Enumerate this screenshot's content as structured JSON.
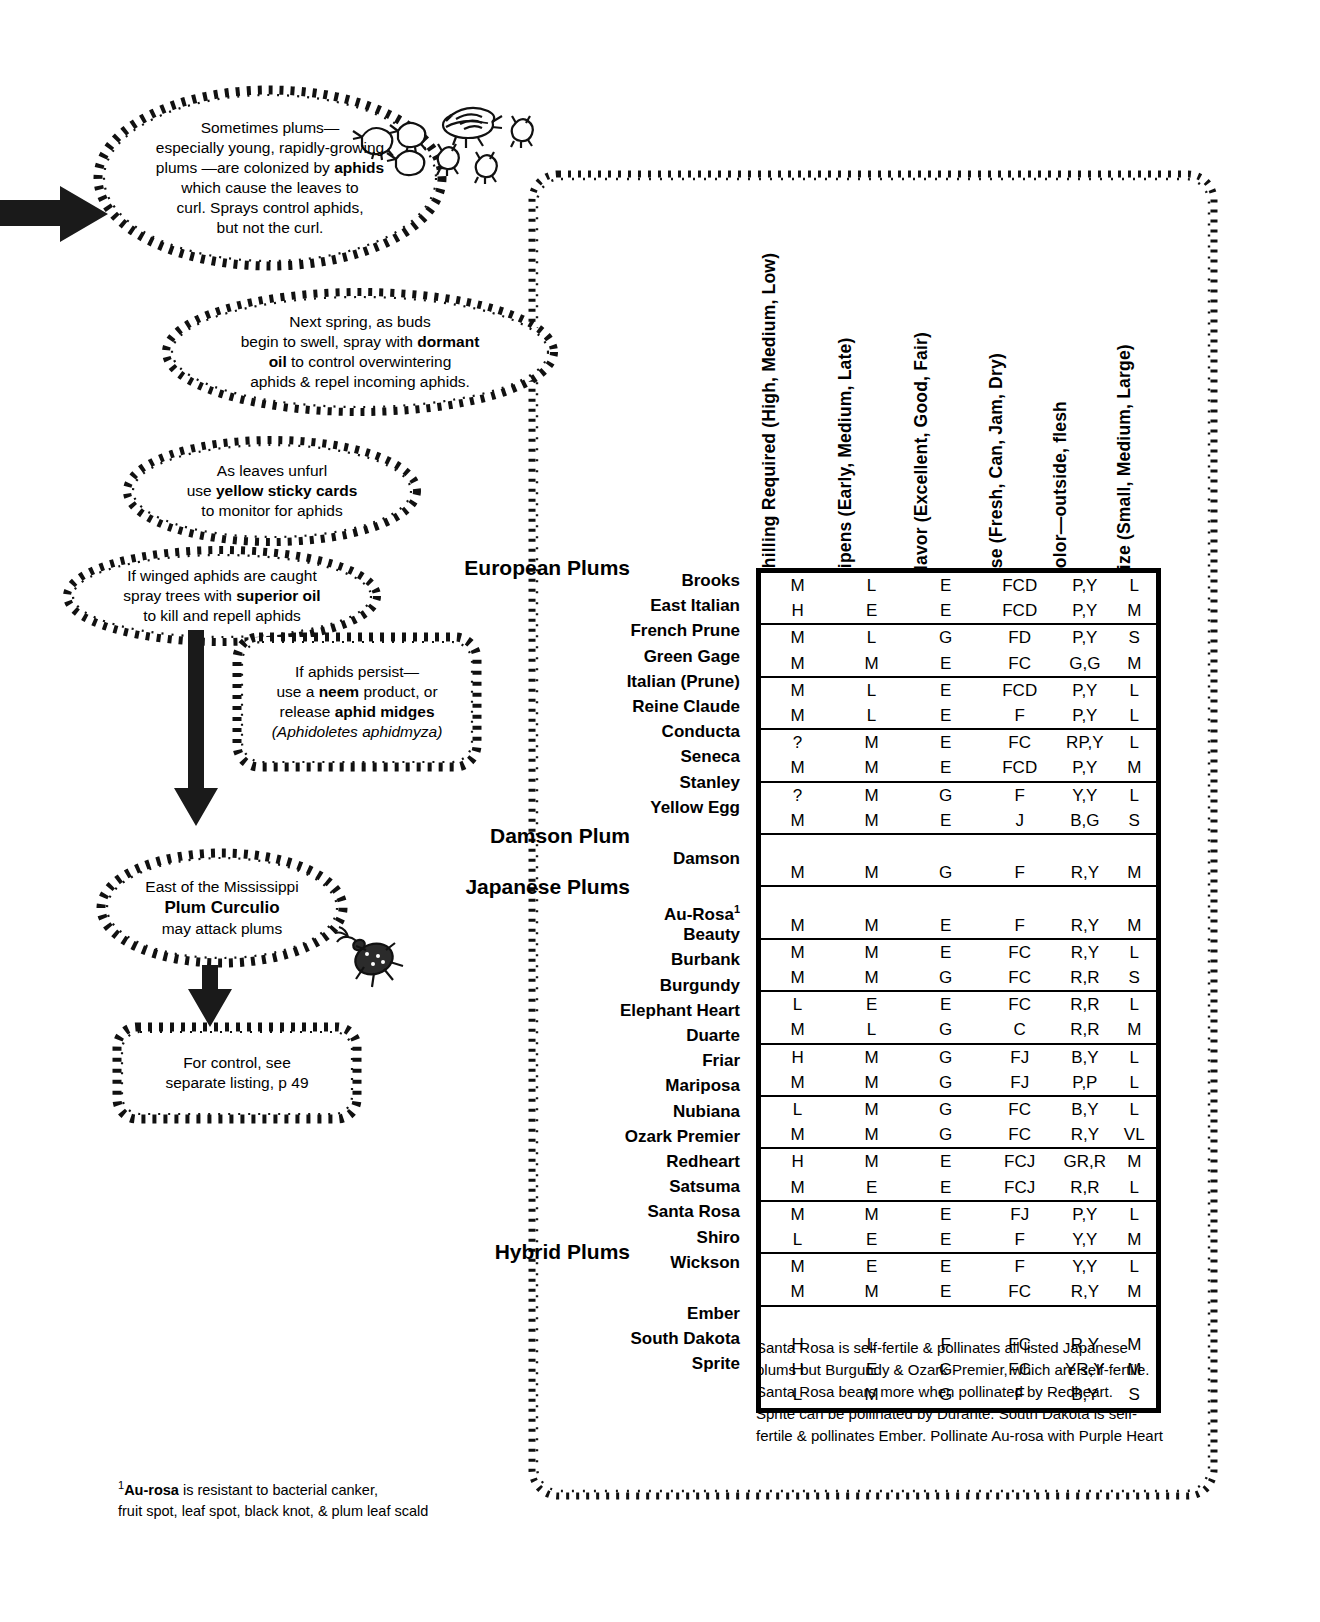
{
  "callouts": [
    {
      "id": "aphid-colonization",
      "lines": [
        {
          "runs": [
            {
              "t": "Sometimes plums—",
              "b": false
            }
          ]
        },
        {
          "runs": [
            {
              "t": "especially young, rapidly-growing",
              "b": false
            }
          ]
        },
        {
          "runs": [
            {
              "t": "plums —are colonized by ",
              "b": false
            },
            {
              "t": "aphids",
              "b": true
            }
          ]
        },
        {
          "runs": [
            {
              "t": "which cause the leaves to",
              "b": false
            }
          ]
        },
        {
          "runs": [
            {
              "t": "curl.  Sprays control aphids,",
              "b": false
            }
          ]
        },
        {
          "runs": [
            {
              "t": "but not the curl.",
              "b": false
            }
          ]
        }
      ]
    },
    {
      "id": "dormant-oil",
      "lines": [
        {
          "runs": [
            {
              "t": "Next spring, as buds",
              "b": false
            }
          ]
        },
        {
          "runs": [
            {
              "t": "begin to swell, spray with ",
              "b": false
            },
            {
              "t": "dormant",
              "b": true
            }
          ]
        },
        {
          "runs": [
            {
              "t": "oil",
              "b": true
            },
            {
              "t": "  to control overwintering",
              "b": false
            }
          ]
        },
        {
          "runs": [
            {
              "t": "aphids & repel incoming aphids.",
              "b": false
            }
          ]
        }
      ]
    },
    {
      "id": "yellow-sticky-cards",
      "lines": [
        {
          "runs": [
            {
              "t": "As leaves unfurl",
              "b": false
            }
          ]
        },
        {
          "runs": [
            {
              "t": "use ",
              "b": false
            },
            {
              "t": "yellow sticky cards",
              "b": true
            }
          ]
        },
        {
          "runs": [
            {
              "t": "to monitor for aphids",
              "b": false
            }
          ]
        }
      ]
    },
    {
      "id": "superior-oil",
      "lines": [
        {
          "runs": [
            {
              "t": "If winged aphids are caught",
              "b": false
            }
          ]
        },
        {
          "runs": [
            {
              "t": "spray trees with ",
              "b": false
            },
            {
              "t": "superior oil",
              "b": true
            }
          ]
        },
        {
          "runs": [
            {
              "t": "to kill and repell aphids",
              "b": false
            }
          ]
        }
      ]
    },
    {
      "id": "neem-aphid-midges",
      "lines": [
        {
          "runs": [
            {
              "t": "If aphids persist—",
              "b": false
            }
          ]
        },
        {
          "runs": [
            {
              "t": "use a ",
              "b": false
            },
            {
              "t": "neem",
              "b": true
            },
            {
              "t": " product, or",
              "b": false
            }
          ]
        },
        {
          "runs": [
            {
              "t": "release ",
              "b": false
            },
            {
              "t": "aphid midges",
              "b": true
            }
          ]
        },
        {
          "runs": [
            {
              "t": "(Aphidoletes aphidmyza)",
              "b": false,
              "i": true
            }
          ]
        }
      ]
    },
    {
      "id": "plum-curculio",
      "lines": [
        {
          "runs": [
            {
              "t": "East of the Mississippi",
              "b": false
            }
          ]
        },
        {
          "runs": [
            {
              "t": "Plum Curculio",
              "b": true
            }
          ]
        },
        {
          "runs": [
            {
              "t": "may attack plums",
              "b": false
            }
          ]
        }
      ]
    },
    {
      "id": "see-separate-listing",
      "lines": [
        {
          "runs": [
            {
              "t": "For control, see",
              "b": false
            }
          ]
        },
        {
          "runs": [
            {
              "t": "separate listing, p 49",
              "b": false
            }
          ]
        }
      ]
    }
  ],
  "table": {
    "column_headers": [
      "Chilling Required (High, Medium, Low)",
      "Ripens (Early,  Medium,  Late)",
      "Flavor (Excellent, Good, Fair)",
      "Use (Fresh, Can, Jam, Dry)",
      "Color—outside, flesh",
      "Size (Small, Medium, Large)"
    ],
    "groups": [
      {
        "title": "European Plums",
        "rows": [
          {
            "name": "Brooks",
            "sup": "",
            "chilling": "M",
            "ripens": "L",
            "flavor": "E",
            "use": "FCD",
            "color": "P,Y",
            "size": "L",
            "rule": false
          },
          {
            "name": "East Italian",
            "sup": "",
            "chilling": "H",
            "ripens": "E",
            "flavor": "E",
            "use": "FCD",
            "color": "P,Y",
            "size": "M",
            "rule": true
          },
          {
            "name": "French Prune",
            "sup": "",
            "chilling": "M",
            "ripens": "L",
            "flavor": "G",
            "use": "FD",
            "color": "P,Y",
            "size": "S",
            "rule": false
          },
          {
            "name": "Green Gage",
            "sup": "",
            "chilling": "M",
            "ripens": "M",
            "flavor": "E",
            "use": "FC",
            "color": "G,G",
            "size": "M",
            "rule": true
          },
          {
            "name": "Italian (Prune)",
            "sup": "",
            "chilling": "M",
            "ripens": "L",
            "flavor": "E",
            "use": "FCD",
            "color": "P,Y",
            "size": "L",
            "rule": false
          },
          {
            "name": "Reine Claude",
            "sup": "",
            "chilling": "M",
            "ripens": "L",
            "flavor": "E",
            "use": "F",
            "color": "P,Y",
            "size": "L",
            "rule": true
          },
          {
            "name": "Conducta",
            "sup": "",
            "chilling": "?",
            "ripens": "M",
            "flavor": "E",
            "use": "FC",
            "color": "RP,Y",
            "size": "L",
            "rule": false
          },
          {
            "name": "Seneca",
            "sup": "",
            "chilling": "M",
            "ripens": "M",
            "flavor": "E",
            "use": "FCD",
            "color": "P,Y",
            "size": "M",
            "rule": true
          },
          {
            "name": "Stanley",
            "sup": "",
            "chilling": "?",
            "ripens": "M",
            "flavor": "G",
            "use": "F",
            "color": "Y,Y",
            "size": "L",
            "rule": false
          },
          {
            "name": "Yellow Egg",
            "sup": "",
            "chilling": "M",
            "ripens": "M",
            "flavor": "E",
            "use": "J",
            "color": "B,G",
            "size": "S",
            "rule": true
          }
        ]
      },
      {
        "title": "Damson Plum",
        "rows": [
          {
            "name": "Damson",
            "sup": "",
            "chilling": "M",
            "ripens": "M",
            "flavor": "G",
            "use": "F",
            "color": "R,Y",
            "size": "M",
            "rule": true
          }
        ]
      },
      {
        "title": "Japanese Plums",
        "rows": [
          {
            "name": "Au-Rosa",
            "sup": "1",
            "chilling": "M",
            "ripens": "M",
            "flavor": "E",
            "use": "F",
            "color": "R,Y",
            "size": "M",
            "rule": true
          },
          {
            "name": "Beauty",
            "sup": "",
            "chilling": "M",
            "ripens": "M",
            "flavor": "E",
            "use": "FC",
            "color": "R,Y",
            "size": "L",
            "rule": false
          },
          {
            "name": "Burbank",
            "sup": "",
            "chilling": "M",
            "ripens": "M",
            "flavor": "G",
            "use": "FC",
            "color": "R,R",
            "size": "S",
            "rule": true
          },
          {
            "name": "Burgundy",
            "sup": "",
            "chilling": "L",
            "ripens": "E",
            "flavor": "E",
            "use": "FC",
            "color": "R,R",
            "size": "L",
            "rule": false
          },
          {
            "name": "Elephant Heart",
            "sup": "",
            "chilling": "M",
            "ripens": "L",
            "flavor": "G",
            "use": "C",
            "color": "R,R",
            "size": "M",
            "rule": true
          },
          {
            "name": "Duarte",
            "sup": "",
            "chilling": "H",
            "ripens": "M",
            "flavor": "G",
            "use": "FJ",
            "color": "B,Y",
            "size": "L",
            "rule": false
          },
          {
            "name": "Friar",
            "sup": "",
            "chilling": "M",
            "ripens": "M",
            "flavor": "G",
            "use": "FJ",
            "color": "P,P",
            "size": "L",
            "rule": true
          },
          {
            "name": "Mariposa",
            "sup": "",
            "chilling": "L",
            "ripens": "M",
            "flavor": "G",
            "use": "FC",
            "color": "B,Y",
            "size": "L",
            "rule": false
          },
          {
            "name": "Nubiana",
            "sup": "",
            "chilling": "M",
            "ripens": "M",
            "flavor": "G",
            "use": "FC",
            "color": "R,Y",
            "size": "VL",
            "rule": true
          },
          {
            "name": "Ozark Premier",
            "sup": "",
            "chilling": "H",
            "ripens": "M",
            "flavor": "E",
            "use": "FCJ",
            "color": "GR,R",
            "size": "M",
            "rule": false
          },
          {
            "name": "Redheart",
            "sup": "",
            "chilling": "M",
            "ripens": "E",
            "flavor": "E",
            "use": "FCJ",
            "color": "R,R",
            "size": "L",
            "rule": true
          },
          {
            "name": "Satsuma",
            "sup": "",
            "chilling": "M",
            "ripens": "M",
            "flavor": "E",
            "use": "FJ",
            "color": "P,Y",
            "size": "L",
            "rule": false
          },
          {
            "name": "Santa Rosa",
            "sup": "",
            "chilling": "L",
            "ripens": "E",
            "flavor": "E",
            "use": "F",
            "color": "Y,Y",
            "size": "M",
            "rule": true
          },
          {
            "name": "Shiro",
            "sup": "",
            "chilling": "M",
            "ripens": "E",
            "flavor": "E",
            "use": "F",
            "color": "Y,Y",
            "size": "L",
            "rule": false
          },
          {
            "name": "Wickson",
            "sup": "",
            "chilling": "M",
            "ripens": "M",
            "flavor": "E",
            "use": "FC",
            "color": "R,Y",
            "size": "M",
            "rule": true
          }
        ]
      },
      {
        "title": "Hybrid Plums",
        "rows": [
          {
            "name": "Ember",
            "sup": "",
            "chilling": "H",
            "ripens": "L",
            "flavor": "F",
            "use": "FC",
            "color": "R,Y",
            "size": "M",
            "rule": false
          },
          {
            "name": "South Dakota",
            "sup": "",
            "chilling": "H",
            "ripens": "E",
            "flavor": "G",
            "use": "FC",
            "color": "YR,Y",
            "size": "M",
            "rule": false
          },
          {
            "name": "Sprite",
            "sup": "",
            "chilling": "L",
            "ripens": "M",
            "flavor": "G",
            "use": "F",
            "color": "B,Y",
            "size": "S",
            "rule": false
          }
        ]
      }
    ]
  },
  "pollination_note": "Santa Rosa is self-fertile & pollinates all listed Japanese\nplums but Burgundy & Ozark Premier, which are self-fertile.\nSanta Rosa bears more when pollinated by  Redheart.\nSprite can be pollinated by Durante.  South Dakota is self-\nfertile & pollinates Ember. Pollinate Au-rosa with Purple Heart",
  "footnote": {
    "marker": "1",
    "bold": "Au-rosa",
    "rest": " is resistant to bacterial canker,",
    "line2": "fruit spot, leaf spot, black knot, & plum leaf scald"
  }
}
